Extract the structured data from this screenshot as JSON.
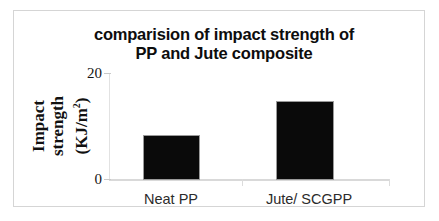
{
  "chart_data": {
    "type": "bar",
    "title": "comparision of impact strength of PP and Jute composite",
    "title_lines": [
      "comparision of impact strength of",
      "PP and Jute composite"
    ],
    "categories": [
      "Neat PP",
      "Jute/ SCGPP"
    ],
    "values": [
      8.5,
      15.0
    ],
    "xlabel": "",
    "ylabel": "Impact strength (KJ/m2)",
    "ylabel_lines": [
      "Impact",
      "strength",
      "(KJ/m",
      "2",
      ")"
    ],
    "ylabel_line1": "Impact",
    "ylabel_line2": "strength",
    "ylabel_line3_pre": "(KJ/m",
    "ylabel_line3_sup": "2",
    "ylabel_line3_post": ")",
    "ylim": [
      0,
      20
    ],
    "yticks": [
      0,
      20
    ],
    "ytick_labels": [
      "20",
      "0"
    ],
    "ytick_top": "20",
    "ytick_bottom": "0",
    "grid": false,
    "legend": false,
    "bar_color": "#0a0a0a",
    "axis_color": "#d9d9d9",
    "frame_color": "#d5d5d5",
    "background": "#ffffff"
  }
}
